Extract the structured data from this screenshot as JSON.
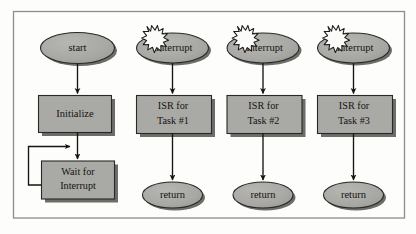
{
  "figure": {
    "frame": {
      "border_color": "#8b8b88",
      "background": "#fdfdfc"
    }
  },
  "style": {
    "node_fill": "#a9a9a6",
    "node_stroke": "#2a2724",
    "shadow_fill": "#6d6d6a",
    "arrow_color": "#17140f",
    "text_color": "#16130f",
    "burst_fill": "#fbfbf9",
    "burst_stroke": "#1d1a16"
  },
  "columns": [
    {
      "name": "main-loop",
      "nodes": [
        {
          "id": "start",
          "shape": "ellipse",
          "label": "start",
          "burst": false
        },
        {
          "id": "initialize",
          "shape": "process",
          "lines": [
            "Initialize"
          ]
        },
        {
          "id": "wait-for-interrupt",
          "shape": "process",
          "lines": [
            "Wait for",
            "Interrupt"
          ]
        }
      ],
      "loop": {
        "from": "wait-for-interrupt",
        "to": "initialize-output",
        "label": ""
      }
    },
    {
      "name": "isr-task-1",
      "nodes": [
        {
          "id": "interrupt-1",
          "shape": "ellipse",
          "label": "Interrupt",
          "burst": true
        },
        {
          "id": "isr-1",
          "shape": "process",
          "lines": [
            "ISR for",
            "Task #1"
          ]
        },
        {
          "id": "return-1",
          "shape": "ellipse",
          "label": "return",
          "burst": false
        }
      ]
    },
    {
      "name": "isr-task-2",
      "nodes": [
        {
          "id": "interrupt-2",
          "shape": "ellipse",
          "label": "Interrupt",
          "burst": true
        },
        {
          "id": "isr-2",
          "shape": "process",
          "lines": [
            "ISR for",
            "Task #2"
          ]
        },
        {
          "id": "return-2",
          "shape": "ellipse",
          "label": "return",
          "burst": false
        }
      ]
    },
    {
      "name": "isr-task-3",
      "nodes": [
        {
          "id": "interrupt-3",
          "shape": "ellipse",
          "label": "Interrupt",
          "burst": true
        },
        {
          "id": "isr-3",
          "shape": "process",
          "lines": [
            "ISR for",
            "Task #3"
          ]
        },
        {
          "id": "return-3",
          "shape": "ellipse",
          "label": "return",
          "burst": false
        }
      ]
    }
  ],
  "labels": {
    "start": "start",
    "initialize": "Initialize",
    "wait_line1": "Wait for",
    "wait_line2": "Interrupt",
    "interrupt1": "Interrupt",
    "interrupt2": "Interrupt",
    "interrupt3": "Interrupt",
    "isr1_line1": "ISR for",
    "isr1_line2": "Task #1",
    "isr2_line1": "ISR for",
    "isr2_line2": "Task #2",
    "isr3_line1": "ISR for",
    "isr3_line2": "Task #3",
    "return1": "return",
    "return2": "return",
    "return3": "return"
  }
}
